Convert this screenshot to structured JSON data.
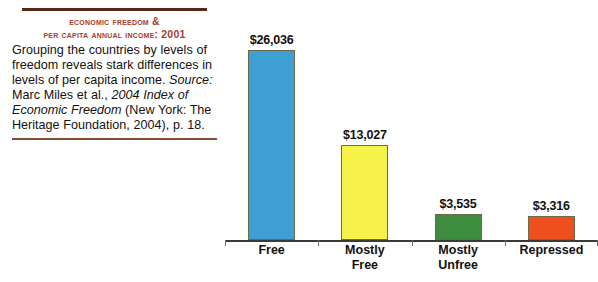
{
  "caption": {
    "title_line1": "Economic Freedom &",
    "title_line2": "Per Capita Annual Income: 2001",
    "body_part1": "Grouping the countries by levels of freedom reveals stark differences in levels of per capita income. ",
    "body_source_label": "Source:",
    "body_part2": " Marc Miles et al., ",
    "body_italic_title": "2004 Index of Economic Freedom",
    "body_part3": " (New York: The Heritage Foundation, 2004), p. 18.",
    "title_color": "#a8402a",
    "rule_color": "#5a2616"
  },
  "chart_data": {
    "type": "bar",
    "title": "Economic Freedom & Per Capita Annual Income: 2001",
    "xlabel": "",
    "ylabel": "",
    "ylim": [
      0,
      28000
    ],
    "grid": false,
    "legend": "none",
    "categories": [
      "Free",
      "Mostly Free",
      "Mostly Unfree",
      "Repressed"
    ],
    "category_lines": [
      [
        "Free",
        ""
      ],
      [
        "Mostly",
        "Free"
      ],
      [
        "Mostly",
        "Unfree"
      ],
      [
        "Repressed",
        ""
      ]
    ],
    "values": [
      26036,
      13027,
      3535,
      3316
    ],
    "value_labels": [
      "$26,036",
      "$13,027",
      "$3,535",
      "$3,316"
    ],
    "colors": [
      "#3f9ed4",
      "#f7f24a",
      "#3e8d3e",
      "#ee4f1c"
    ],
    "bar_border_color": "#6b6b4a"
  }
}
